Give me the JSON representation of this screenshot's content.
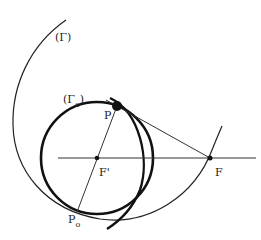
{
  "diagram": {
    "labels": {
      "gamma": "(Γ)",
      "gamma0_open": "(Γ",
      "gamma0_sub": "o",
      "gamma0_close": ")",
      "p": "P",
      "p0": "P",
      "p0_sub": "o",
      "f_prime": "F'",
      "f": "F"
    },
    "points": {
      "P": [
        117,
        106
      ],
      "F_prime": [
        97,
        158
      ],
      "F": [
        210,
        158
      ],
      "P0": [
        77,
        212
      ]
    },
    "colors": {
      "stroke": "#222222",
      "background": "#ffffff"
    }
  }
}
